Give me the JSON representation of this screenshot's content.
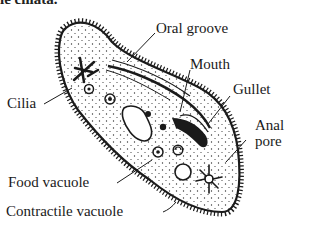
{
  "caption": "ie ciliata.",
  "diagram": {
    "labels": {
      "oral_groove": "Oral groove",
      "mouth": "Mouth",
      "gullet": "Gullet",
      "anal_pore_line1": "Anal",
      "anal_pore_line2": "pore",
      "cilia": "Cilia",
      "food_vacuole": "Food vacuole",
      "contractile_vacuole": "Contractile vacuole"
    },
    "colors": {
      "ink": "#1a1a1a",
      "background": "#ffffff"
    }
  }
}
